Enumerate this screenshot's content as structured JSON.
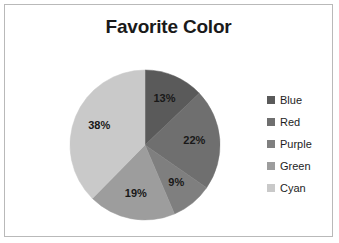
{
  "chart_data": {
    "type": "pie",
    "title": "Favorite Color",
    "categories": [
      "Blue",
      "Red",
      "Purple",
      "Green",
      "Cyan"
    ],
    "values": [
      13,
      22,
      9,
      19,
      38
    ],
    "value_labels": [
      "13%",
      "22%",
      "9%",
      "19%",
      "38%"
    ],
    "slice_colors": [
      "#5a5a5a",
      "#6f6f6f",
      "#7f7f7f",
      "#9d9d9d",
      "#c9c9c9"
    ],
    "start_angle_deg": 0,
    "direction": "clockwise",
    "legend_position": "right",
    "grid": false,
    "xlabel": "",
    "ylabel": ""
  },
  "frame": {
    "border_color": "#b9b9b9",
    "background": "#ffffff"
  },
  "legend": {
    "items": [
      {
        "label": "Blue",
        "color": "#5a5a5a"
      },
      {
        "label": "Red",
        "color": "#6f6f6f"
      },
      {
        "label": "Purple",
        "color": "#7f7f7f"
      },
      {
        "label": "Green",
        "color": "#9d9d9d"
      },
      {
        "label": "Cyan",
        "color": "#c9c9c9"
      }
    ]
  }
}
